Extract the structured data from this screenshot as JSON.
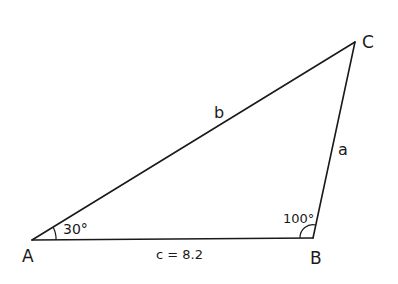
{
  "diagram": {
    "type": "triangle",
    "vertices": {
      "A": {
        "label": "A",
        "x": 32,
        "y": 240
      },
      "B": {
        "label": "B",
        "x": 313,
        "y": 238
      },
      "C": {
        "label": "C",
        "x": 355,
        "y": 42
      }
    },
    "sides": {
      "a": {
        "label": "a"
      },
      "b": {
        "label": "b"
      },
      "c": {
        "label": "c = 8.2"
      }
    },
    "angles": {
      "A": {
        "label": "30°"
      },
      "B": {
        "label": "100°"
      }
    },
    "colors": {
      "stroke": "#1a1a1a",
      "background": "#ffffff"
    }
  }
}
